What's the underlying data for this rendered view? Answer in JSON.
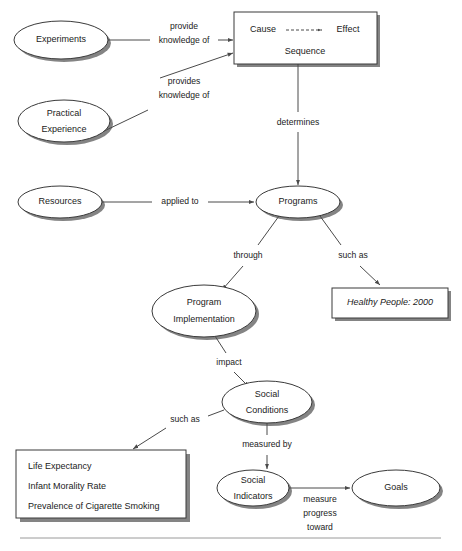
{
  "diagram": {
    "nodes": [
      {
        "id": "experiments",
        "shape": "ellipse",
        "label": "Experiments",
        "lines": [
          "Experiments"
        ],
        "cx": 61,
        "cy": 40,
        "rx": 47,
        "ry": 19
      },
      {
        "id": "practical-experience",
        "shape": "ellipse",
        "label": "Practical Experience",
        "lines": [
          "Practical",
          "Experience"
        ],
        "cx": 64,
        "cy": 121,
        "rx": 46,
        "ry": 21
      },
      {
        "id": "resources",
        "shape": "ellipse",
        "label": "Resources",
        "lines": [
          "Resources"
        ],
        "cx": 60,
        "cy": 202,
        "rx": 42,
        "ry": 16
      },
      {
        "id": "programs",
        "shape": "ellipse",
        "label": "Programs",
        "lines": [
          "Programs"
        ],
        "cx": 298,
        "cy": 202,
        "rx": 42,
        "ry": 16
      },
      {
        "id": "program-implementation",
        "shape": "ellipse",
        "label": "Program Implementation",
        "lines": [
          "Program",
          "Implementation"
        ],
        "cx": 204,
        "cy": 311,
        "rx": 52,
        "ry": 26
      },
      {
        "id": "social-conditions",
        "shape": "ellipse",
        "label": "Social Conditions",
        "lines": [
          "Social",
          "Conditions"
        ],
        "cx": 267,
        "cy": 402,
        "rx": 45,
        "ry": 21
      },
      {
        "id": "social-indicators",
        "shape": "ellipse",
        "label": "Social Indicators",
        "lines": [
          "Social",
          "Indicators"
        ],
        "cx": 253,
        "cy": 488,
        "rx": 36,
        "ry": 18
      },
      {
        "id": "goals",
        "shape": "ellipse",
        "label": "Goals",
        "lines": [
          "Goals"
        ],
        "cx": 396,
        "cy": 488,
        "rx": 44,
        "ry": 18
      }
    ],
    "cause_effect_box": {
      "id": "cause-effect-sequence",
      "x": 234,
      "y": 12,
      "w": 143,
      "h": 52,
      "cause_label": "Cause",
      "effect_label": "Effect",
      "sequence_label": "Sequence"
    },
    "healthy_people_box": {
      "id": "healthy-people-box",
      "x": 332,
      "y": 288,
      "w": 116,
      "h": 30,
      "label": "Healthy People: 2000",
      "italic": true
    },
    "indicators_box": {
      "id": "social-indicator-examples-box",
      "x": 16,
      "y": 450,
      "w": 170,
      "h": 68,
      "items": [
        "Life Expectancy",
        "Infant Morality Rate",
        "Prevalence of Cigarette Smoking"
      ]
    },
    "edges": [
      {
        "id": "experiments-to-cause",
        "from": "experiments",
        "to": "cause-effect-sequence",
        "label": "provide knowledge of",
        "label_lines": [
          "provide",
          "knowledge of"
        ],
        "label_x": 184,
        "label_y": 33
      },
      {
        "id": "practical-to-cause",
        "from": "practical-experience",
        "to": "cause-effect-sequence",
        "label": "provides knowledge of",
        "label_lines": [
          "provides",
          "knowledge of"
        ],
        "label_x": 184,
        "label_y": 88
      },
      {
        "id": "cause-to-programs",
        "from": "cause-effect-sequence",
        "to": "programs",
        "label": "determines",
        "label_lines": [
          "determines"
        ],
        "label_x": 298,
        "label_y": 123
      },
      {
        "id": "resources-to-programs",
        "from": "resources",
        "to": "programs",
        "label": "applied to",
        "label_lines": [
          "applied to"
        ],
        "label_x": 180,
        "label_y": 202
      },
      {
        "id": "programs-to-implementation",
        "from": "programs",
        "to": "program-implementation",
        "label": "through",
        "label_lines": [
          "through"
        ],
        "label_x": 248,
        "label_y": 256
      },
      {
        "id": "programs-to-healthy-people",
        "from": "programs",
        "to": "healthy-people-box",
        "label": "such as",
        "label_lines": [
          "such as"
        ],
        "label_x": 353,
        "label_y": 256
      },
      {
        "id": "implementation-to-social-conditions",
        "from": "program-implementation",
        "to": "social-conditions",
        "label": "impact",
        "label_lines": [
          "impact"
        ],
        "label_x": 229,
        "label_y": 363
      },
      {
        "id": "social-conditions-to-indicators-box",
        "from": "social-conditions",
        "to": "social-indicator-examples-box",
        "label": "such as",
        "label_lines": [
          "such as"
        ],
        "label_x": 185,
        "label_y": 420
      },
      {
        "id": "social-conditions-to-social-indicators",
        "from": "social-conditions",
        "to": "social-indicators",
        "label": "measured by",
        "label_lines": [
          "measured by"
        ],
        "label_x": 267,
        "label_y": 445
      },
      {
        "id": "social-indicators-to-goals",
        "from": "social-indicators",
        "to": "goals",
        "label": "measure progress toward",
        "label_lines": [
          "measure",
          "progress",
          "toward"
        ],
        "label_x": 320,
        "label_y": 500
      }
    ],
    "divider": {
      "id": "footer-divider",
      "x1": 20,
      "y1": 538,
      "x2": 441,
      "y2": 538
    },
    "colors": {
      "stroke": "#3a3a3a",
      "edge": "#4a4a4a",
      "shadow": "#6e6e6e",
      "text": "#1b1b1b",
      "background": "#ffffff",
      "divider": "#9a9a9a"
    }
  }
}
